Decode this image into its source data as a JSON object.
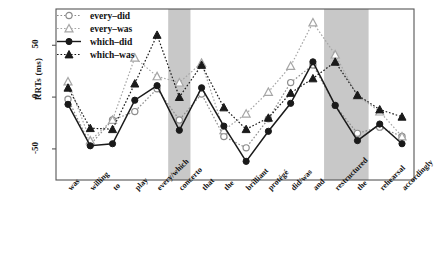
{
  "chart_data": {
    "type": "line",
    "title": "",
    "xlabel": "",
    "ylabel": "RRTs (ms)",
    "ylim": [
      -80,
      85
    ],
    "yticks": [
      -50,
      0,
      50
    ],
    "ytick_labels": [
      "-50",
      "0",
      "50"
    ],
    "grid": false,
    "legend_position": "top-left",
    "categories": [
      "was",
      "willing",
      "to",
      "play",
      "every/which",
      "concerto",
      "that",
      "the",
      "brilliant",
      "protégé",
      "did/was",
      "and",
      "restructured",
      "the",
      "rehearsal",
      "accordingly"
    ],
    "shaded_regions": [
      {
        "from_index": 5,
        "to_index": 5,
        "label": "concerto"
      },
      {
        "from_index": 12,
        "to_index": 13,
        "label": "restructured-the"
      }
    ],
    "series": [
      {
        "name": "every-did",
        "marker": "open-circle",
        "line_style": "dotted",
        "color": "#8c8c8c",
        "values": [
          -2,
          -46,
          -22,
          -14,
          8,
          -22,
          3,
          -38,
          -49,
          -21,
          14,
          31,
          -8,
          -35,
          -29,
          -38
        ]
      },
      {
        "name": "every-was",
        "marker": "open-triangle",
        "line_style": "dotted",
        "color": "#a6a6a6",
        "values": [
          15,
          -42,
          -22,
          38,
          20,
          14,
          33,
          -32,
          -16,
          5,
          30,
          72,
          41,
          1,
          -14,
          -38
        ]
      },
      {
        "name": "which-did",
        "marker": "filled-circle",
        "line_style": "solid",
        "color": "#1a1a1a",
        "values": [
          -7,
          -47,
          -45,
          -3,
          11,
          -32,
          9,
          -28,
          -62,
          -33,
          -6,
          34,
          -8,
          -42,
          -26,
          -45
        ]
      },
      {
        "name": "which-was",
        "marker": "filled-triangle",
        "line_style": "dotted",
        "color": "#1a1a1a",
        "values": [
          9,
          -30,
          -31,
          13,
          60,
          0,
          31,
          -10,
          -31,
          -20,
          4,
          18,
          34,
          2,
          -12,
          -19
        ]
      }
    ]
  },
  "legend": {
    "items": [
      {
        "label": "every–did"
      },
      {
        "label": "every–was"
      },
      {
        "label": "which–did"
      },
      {
        "label": "which–was"
      }
    ]
  },
  "axis": {
    "y_title": "RRTs (ms)",
    "y_tick_0": "50",
    "y_tick_1": "0",
    "y_tick_2": "-50"
  },
  "colors": {
    "shade": "#c8c8c8",
    "axis": "#555555",
    "dark": "#1a1a1a",
    "light": "#9a9a9a"
  }
}
